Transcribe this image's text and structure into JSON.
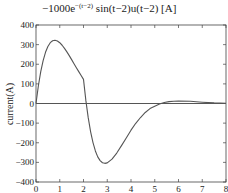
{
  "chart_data": {
    "type": "line",
    "title_parts": {
      "coef": "−1000e",
      "exp": "−(t−2)",
      "rest": " sin(t−2)u(t−2) [A]"
    },
    "xlabel": "",
    "ylabel": "current(A)",
    "xlim": [
      0,
      8
    ],
    "ylim": [
      -400,
      400
    ],
    "xticks": [
      0,
      1,
      2,
      3,
      4,
      5,
      6,
      7,
      8
    ],
    "xtick_labels": [
      "0",
      "1",
      "2",
      "3",
      "4",
      "5",
      "6",
      "7",
      "8"
    ],
    "yticks": [
      400,
      300,
      200,
      100,
      0,
      -100,
      -200,
      -300,
      -400
    ],
    "ytick_labels": [
      "400",
      "300",
      "200",
      "100",
      "0",
      "−100",
      "−200",
      "−300",
      "−400"
    ],
    "grid": false,
    "legend": null,
    "series": [
      {
        "name": "current",
        "color": "#555555",
        "x": [
          0,
          0.1,
          0.2,
          0.3,
          0.4,
          0.5,
          0.6,
          0.7,
          0.8,
          0.9,
          1.0,
          1.1,
          1.2,
          1.3,
          1.4,
          1.5,
          1.6,
          1.7,
          1.8,
          1.9,
          2.0,
          2.1,
          2.2,
          2.3,
          2.4,
          2.5,
          2.6,
          2.7,
          2.8,
          2.9,
          3.0,
          3.2,
          3.4,
          3.6,
          3.8,
          4.0,
          4.2,
          4.4,
          4.6,
          4.8,
          5.0,
          5.2,
          5.4,
          5.6,
          5.8,
          6.0,
          6.5,
          7.0,
          7.5,
          8.0
        ],
        "values": [
          0,
          90.3,
          162.7,
          218.9,
          261.0,
          290.8,
          309.9,
          319.9,
          322.3,
          318.4,
          309.6,
          296.8,
          281.1,
          263.2,
          243.9,
          223.6,
          203.0,
          182.5,
          162.4,
          143.0,
          123.1,
          14.6,
          -73.5,
          -144.4,
          -199.2,
          -241.7,
          -271.8,
          -291.0,
          -301.8,
          -304.9,
          -302.6,
          -283.6,
          -252.5,
          -214.9,
          -175.6,
          -135.9,
          -100.9,
          -71.4,
          -45.6,
          -25.9,
          -13.5,
          -2.3,
          5.1,
          9.5,
          11.8,
          12.1,
          11.2,
          6.7,
          3.1,
          1.0
        ]
      },
      {
        "name": "zero-line",
        "color": "#555555",
        "x": [
          0,
          8
        ],
        "values": [
          0,
          0
        ]
      }
    ]
  },
  "plot_area": {
    "left": 36,
    "top": 25,
    "right": 226,
    "bottom": 182
  }
}
